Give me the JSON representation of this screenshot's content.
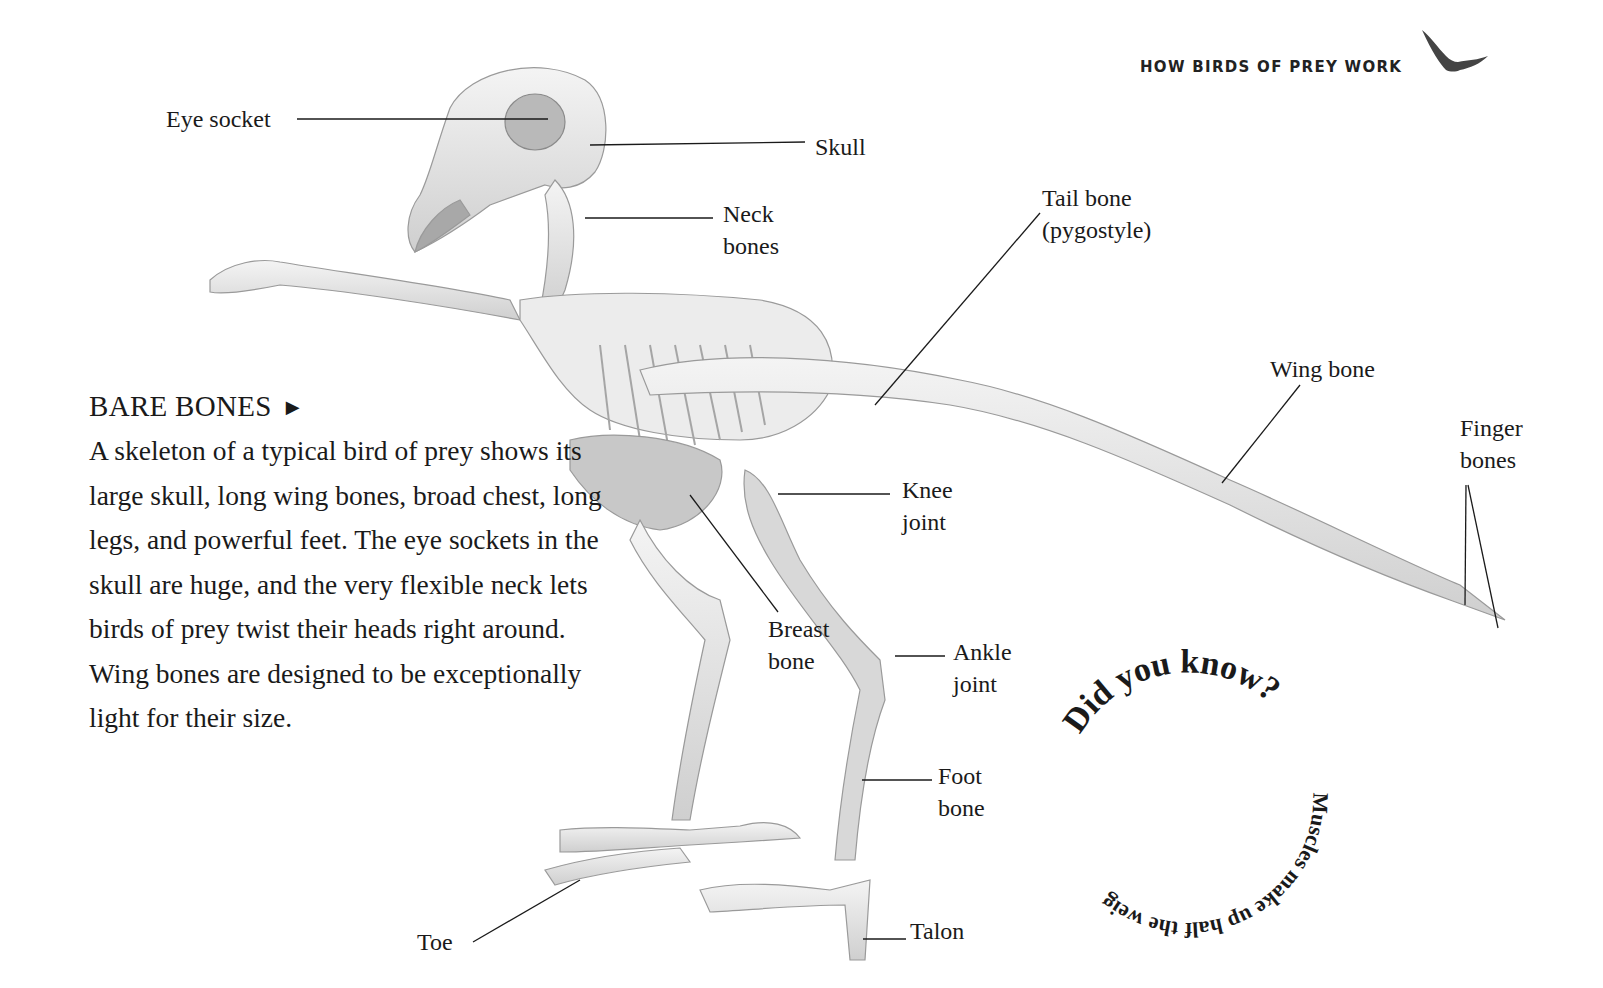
{
  "header": {
    "running_title": "HOW BIRDS OF PREY WORK",
    "icon": "eagle-silhouette-icon"
  },
  "sidebar": {
    "heading": "BARE BONES",
    "heading_arrow": "▶",
    "body": "A skeleton of a typical bird of prey shows its large skull, long wing bones, broad chest, long legs, and powerful feet. The eye sockets in the skull are huge, and the very flexible neck lets birds of prey twist their heads right around. Wing bones are designed to be exceptionally light for their size."
  },
  "labels": {
    "eye_socket": "Eye socket",
    "skull": "Skull",
    "neck_bones_1": "Neck",
    "neck_bones_2": "bones",
    "tail_bone_1": "Tail bone",
    "tail_bone_2": "(pygostyle)",
    "wing_bone": "Wing bone",
    "finger_bones_1": "Finger",
    "finger_bones_2": "bones",
    "knee_joint_1": "Knee",
    "knee_joint_2": "joint",
    "breast_bone_1": "Breast",
    "breast_bone_2": "bone",
    "ankle_joint_1": "Ankle",
    "ankle_joint_2": "joint",
    "foot_bone_1": "Foot",
    "foot_bone_2": "bone",
    "toe": "Toe",
    "talon": "Talon"
  },
  "did_you_know": {
    "title": "Did you know?",
    "fact": "Muscles make up half the weight of a bird of prey."
  },
  "image": {
    "subject": "bird-of-prey-skeleton",
    "style": "grayscale photograph"
  }
}
